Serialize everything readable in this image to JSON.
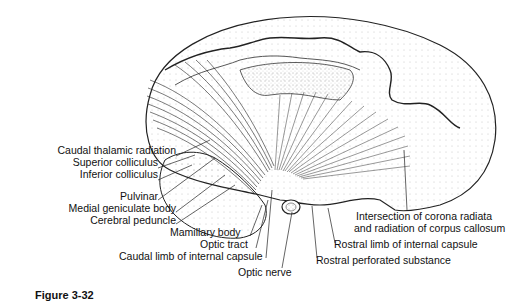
{
  "figure": {
    "caption_partial": "Figure 3-32"
  },
  "labels_left": [
    {
      "text": "Caudal thalamic radiation",
      "x": 176,
      "y": 150
    },
    {
      "text": "Superior colliculus",
      "x": 158,
      "y": 162
    },
    {
      "text": "Inferior colliculus",
      "x": 158,
      "y": 174
    },
    {
      "text": "Pulvinar",
      "x": 158,
      "y": 196
    },
    {
      "text": "Medial geniculate body",
      "x": 176,
      "y": 208
    },
    {
      "text": "Cerebral peduncle",
      "x": 176,
      "y": 220
    }
  ],
  "labels_bottom": [
    {
      "text": "Mamillary body",
      "x": 170,
      "y": 232
    },
    {
      "text": "Optic tract",
      "x": 200,
      "y": 244
    },
    {
      "text": "Caudal limb of internal capsule",
      "x": 119,
      "y": 256
    },
    {
      "text": "Optic nerve",
      "x": 238,
      "y": 270
    }
  ],
  "labels_right": [
    {
      "text": "Intersection of corona radiata",
      "x": 356,
      "y": 212
    },
    {
      "text": "and radiation of corpus callosum",
      "x": 354,
      "y": 224
    },
    {
      "text": "Rostral limb of internal capsule",
      "x": 334,
      "y": 239
    },
    {
      "text": "Rostral perforated substance",
      "x": 316,
      "y": 256
    }
  ]
}
